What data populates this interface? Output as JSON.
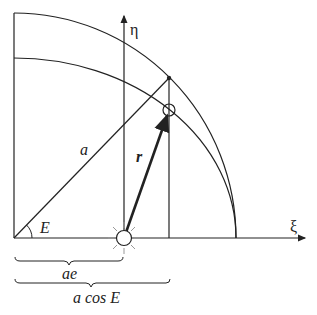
{
  "diagram": {
    "axes": {
      "x_label": "ξ",
      "y_label": "η"
    },
    "labels": {
      "semi_major": "a",
      "radius_vector": "r",
      "eccentric_anomaly": "E",
      "focus_distance": "ae",
      "projection": "a cos E"
    },
    "elements": [
      "auxiliary circle (radius a)",
      "ellipse (orbit)",
      "Sun at focus",
      "planet on ellipse",
      "projected point on auxiliary circle"
    ],
    "colors": {
      "line": "#222222",
      "sun_rays": "#999999"
    }
  }
}
